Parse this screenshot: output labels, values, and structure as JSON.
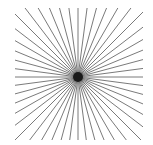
{
  "figure": {
    "label": ")",
    "background_color": "#ffffff"
  },
  "chart_data": {
    "type": "line",
    "subtitle": "",
    "xlabel": "",
    "ylabel": "",
    "grid": false,
    "legend_position": "none",
    "tick_labels": [],
    "annotations": [
      ")"
    ],
    "center": {
      "x": 78,
      "y": 77
    },
    "hub": {
      "radius": 5.0,
      "color": "#1a1a1a"
    },
    "clip_square": {
      "x": 15,
      "y": 8,
      "width": 128,
      "height": 132
    },
    "ray_count": 48,
    "ray_angle_step_deg": 7.5,
    "ray_start_angle_deg": 0,
    "ray_length": 200,
    "ray_color": "#6b6b6b",
    "ray_width": 0.9,
    "axis_ranges": {
      "xlim": [
        15,
        143
      ],
      "ylim": [
        8,
        140
      ]
    }
  }
}
